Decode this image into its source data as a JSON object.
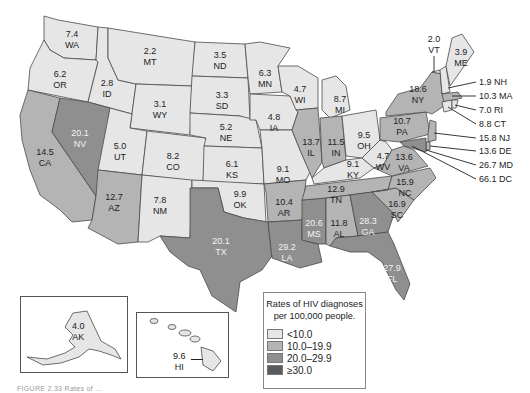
{
  "legend": {
    "title_line1": "Rates of HIV diagnoses",
    "title_line2": "per 100,000 people.",
    "items": [
      {
        "label": "<10.0",
        "color": "#e6e6e6"
      },
      {
        "label": "10.0–19.9",
        "color": "#b4b4b4"
      },
      {
        "label": "20.0–29.9",
        "color": "#8f8f8f"
      },
      {
        "label": "≥30.0",
        "color": "#5a5a5a"
      }
    ]
  },
  "caption": "FIGURE 2.33  Rates of ...",
  "states": {
    "WA": {
      "value": "7.4",
      "abbr": "WA"
    },
    "OR": {
      "value": "6.2",
      "abbr": "OR"
    },
    "CA": {
      "value": "14.5",
      "abbr": "CA"
    },
    "ID": {
      "value": "2.8",
      "abbr": "ID"
    },
    "NV": {
      "value": "20.1",
      "abbr": "NV"
    },
    "MT": {
      "value": "2.2",
      "abbr": "MT"
    },
    "WY": {
      "value": "3.1",
      "abbr": "WY"
    },
    "UT": {
      "value": "5.0",
      "abbr": "UT"
    },
    "AZ": {
      "value": "12.7",
      "abbr": "AZ"
    },
    "CO": {
      "value": "8.2",
      "abbr": "CO"
    },
    "NM": {
      "value": "7.8",
      "abbr": "NM"
    },
    "ND": {
      "value": "3.5",
      "abbr": "ND"
    },
    "SD": {
      "value": "3.3",
      "abbr": "SD"
    },
    "NE": {
      "value": "5.2",
      "abbr": "NE"
    },
    "KS": {
      "value": "6.1",
      "abbr": "KS"
    },
    "OK": {
      "value": "9.9",
      "abbr": "OK"
    },
    "TX": {
      "value": "20.1",
      "abbr": "TX"
    },
    "MN": {
      "value": "6.3",
      "abbr": "MN"
    },
    "IA": {
      "value": "4.8",
      "abbr": "IA"
    },
    "MO": {
      "value": "9.1",
      "abbr": "MO"
    },
    "AR": {
      "value": "10.4",
      "abbr": "AR"
    },
    "LA": {
      "value": "29.2",
      "abbr": "LA"
    },
    "WI": {
      "value": "4.7",
      "abbr": "WI"
    },
    "IL": {
      "value": "13.7",
      "abbr": "IL"
    },
    "MS": {
      "value": "20.6",
      "abbr": "MS"
    },
    "MI": {
      "value": "8.7",
      "abbr": "MI"
    },
    "IN": {
      "value": "11.5",
      "abbr": "IN"
    },
    "KY": {
      "value": "9.1",
      "abbr": "KY"
    },
    "TN": {
      "value": "12.9",
      "abbr": "TN"
    },
    "AL": {
      "value": "11.8",
      "abbr": "AL"
    },
    "OH": {
      "value": "9.5",
      "abbr": "OH"
    },
    "WV": {
      "value": "4.7",
      "abbr": "WV"
    },
    "GA": {
      "value": "28.3",
      "abbr": "GA"
    },
    "FL": {
      "value": "27.9",
      "abbr": "FL"
    },
    "SC": {
      "value": "16.9",
      "abbr": "SC"
    },
    "NC": {
      "value": "15.9",
      "abbr": "NC"
    },
    "VA": {
      "value": "13.6",
      "abbr": "VA"
    },
    "PA": {
      "value": "10.7",
      "abbr": "PA"
    },
    "NY": {
      "value": "18.6",
      "abbr": "NY"
    },
    "VT": {
      "value": "2.0",
      "abbr": "VT"
    },
    "ME": {
      "value": "3.9",
      "abbr": "ME"
    },
    "AK": {
      "value": "4.0",
      "abbr": "AK"
    },
    "HI": {
      "value": "9.6",
      "abbr": "HI"
    }
  },
  "callouts": [
    {
      "text": "1.9 NH"
    },
    {
      "text": "10.3 MA"
    },
    {
      "text": "7.0 RI"
    },
    {
      "text": "8.8 CT"
    },
    {
      "text": "15.8 NJ"
    },
    {
      "text": "13.6 DE"
    },
    {
      "text": "26.7 MD"
    },
    {
      "text": "66.1 DC"
    }
  ]
}
